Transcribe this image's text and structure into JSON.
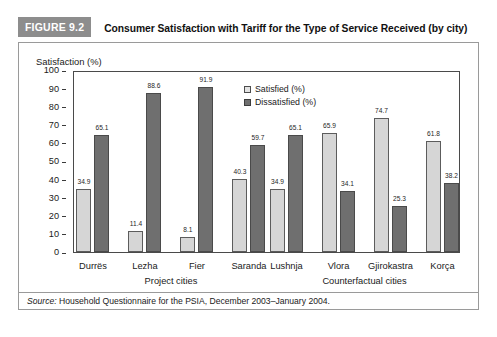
{
  "figure": {
    "tag": "FIGURE 9.2",
    "title": "Consumer Satisfaction with Tariff for the Type of Service Received (by city)",
    "source_prefix": "Source:",
    "source_text": " Household Questionnaire for the PSIA, December 2003–January 2004."
  },
  "chart_data": {
    "type": "bar",
    "title": "Consumer Satisfaction with Tariff for the Type of Service Received (by city)",
    "xlabel": "",
    "ylabel": "Satisfaction (%)",
    "ylim": [
      0,
      100
    ],
    "yticks": [
      0,
      10,
      20,
      30,
      40,
      50,
      60,
      70,
      80,
      90,
      100
    ],
    "ytick_labels": [
      "0",
      "10",
      "20",
      "30",
      "40",
      "50",
      "60",
      "70",
      "80",
      "90",
      "100"
    ],
    "grid": false,
    "legend_position": "upper-center",
    "categories": [
      "Durrës",
      "Lezha",
      "Fier",
      "Saranda",
      "Lushnja",
      "Vlora",
      "Gjirokastra",
      "Korça"
    ],
    "series": [
      {
        "name": "Satisfied (%)",
        "color": "#d6d6d6",
        "values": [
          34.9,
          11.4,
          8.1,
          40.3,
          34.9,
          65.9,
          74.7,
          61.8
        ]
      },
      {
        "name": "Dissatisfied (%)",
        "color": "#6f6f6f",
        "values": [
          65.1,
          88.6,
          91.9,
          59.7,
          65.1,
          34.1,
          25.3,
          38.2
        ]
      }
    ],
    "groups": [
      {
        "caption": "Project cities",
        "categories": [
          "Durrës",
          "Lezha",
          "Fier",
          "Saranda"
        ]
      },
      {
        "caption": "Counterfactual cities",
        "categories": [
          "Lushnja",
          "Vlora",
          "Gjirokastra",
          "Korça"
        ]
      }
    ],
    "data_labels": {
      "Durrës": {
        "satisfied": "34.9",
        "dissatisfied": "65.1"
      },
      "Lezha": {
        "satisfied": "11.4",
        "dissatisfied": "88.6"
      },
      "Fier": {
        "satisfied": "8.1",
        "dissatisfied": "91.9"
      },
      "Saranda": {
        "satisfied": "40.3",
        "dissatisfied": "59.7"
      },
      "Lushnja": {
        "satisfied": "34.9",
        "dissatisfied": "65.1"
      },
      "Vlora": {
        "satisfied": "65.9",
        "dissatisfied": "34.1"
      },
      "Gjirokastra": {
        "satisfied": "74.7",
        "dissatisfied": "25.3"
      },
      "Korça": {
        "satisfied": "61.8",
        "dissatisfied": "38.2"
      }
    }
  }
}
